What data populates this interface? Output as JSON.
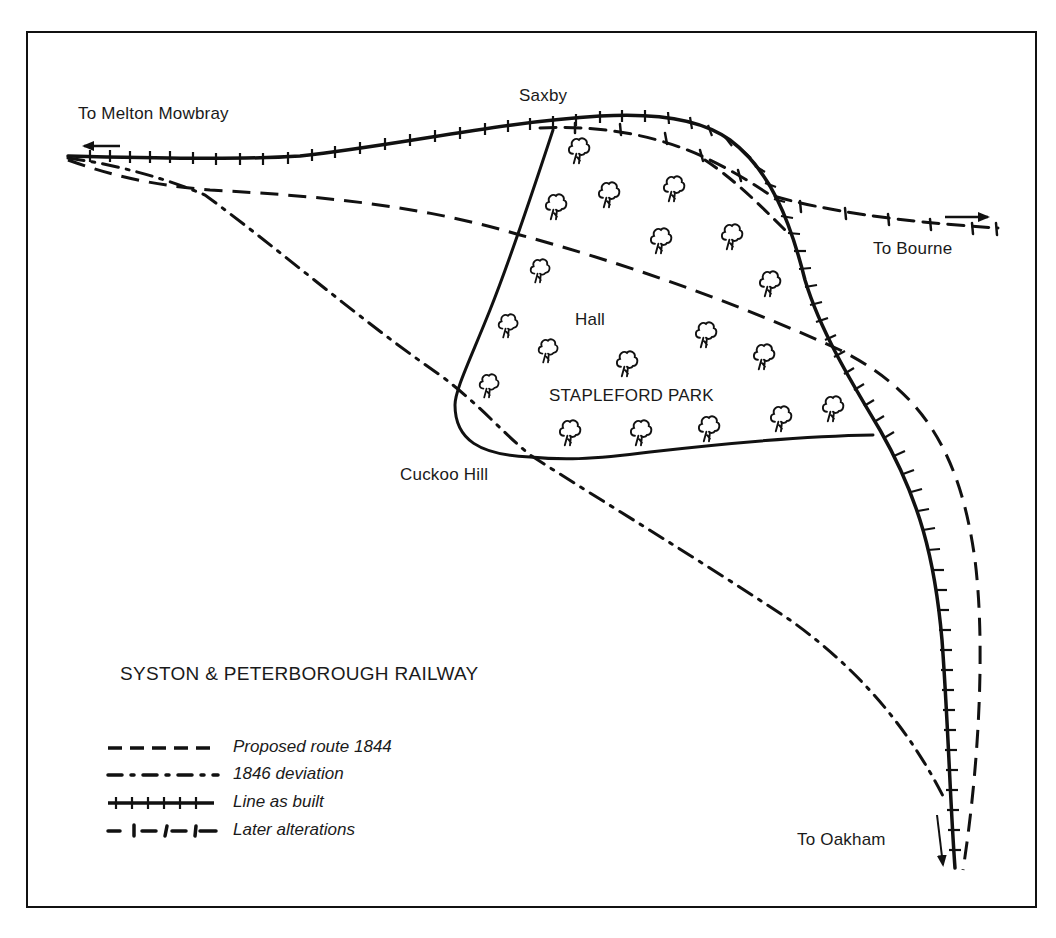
{
  "map": {
    "title": "SYSTON & PETERBOROUGH RAILWAY",
    "place_labels": {
      "melton": "To Melton Mowbray",
      "saxby": "Saxby",
      "bourne": "To Bourne",
      "hall": "Hall",
      "park": "STAPLEFORD PARK",
      "cuckoo": "Cuckoo Hill",
      "oakham": "To Oakham"
    },
    "legend": [
      {
        "style": "dashed",
        "label": "Proposed route 1844"
      },
      {
        "style": "dash-dot",
        "label": "1846 deviation"
      },
      {
        "style": "ticked-solid",
        "label": "Line as built"
      },
      {
        "style": "dash-tick",
        "label": "Later alterations"
      }
    ],
    "direction_arrows": [
      {
        "name": "west-arrow",
        "to": "To Melton Mowbray"
      },
      {
        "name": "east-arrow",
        "to": "To Bourne"
      },
      {
        "name": "south-arrow",
        "to": "To Oakham"
      }
    ],
    "ink_color": "#111111",
    "background_color": "#ffffff"
  }
}
